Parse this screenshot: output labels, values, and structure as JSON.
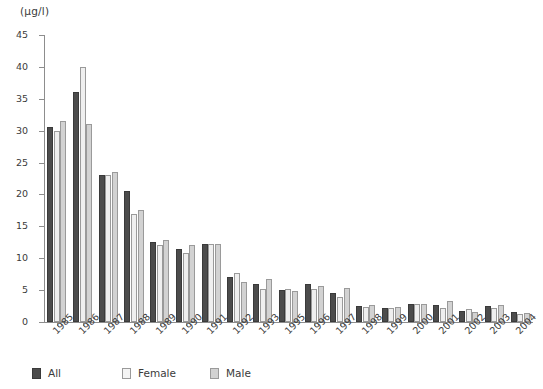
{
  "chart_data": {
    "type": "bar",
    "title": "",
    "subtitle": "",
    "unit_label": "(µg/l)",
    "xlabel": "",
    "ylabel": "",
    "ylim": [
      0,
      45
    ],
    "ytick_step": 5,
    "yticks": [
      0,
      5,
      10,
      15,
      20,
      25,
      30,
      35,
      40,
      45
    ],
    "ytick_labels": [
      "0",
      "5",
      "10",
      "15",
      "20",
      "25",
      "30",
      "35",
      "40",
      "45"
    ],
    "grid": false,
    "legend_position": "bottom-left",
    "categories": [
      "1985",
      "1986",
      "1987",
      "1988",
      "1989",
      "1990",
      "1991",
      "1992",
      "1993",
      "1995",
      "1996",
      "1997",
      "1998",
      "1999",
      "2000",
      "2001",
      "2002",
      "2003",
      "2004"
    ],
    "series": [
      {
        "name": "All",
        "color": "#4c4c4c",
        "values": [
          30.5,
          36.0,
          23.0,
          20.5,
          12.5,
          11.5,
          12.2,
          7.0,
          6.0,
          5.0,
          6.0,
          4.5,
          2.5,
          2.2,
          2.9,
          2.7,
          1.8,
          2.5,
          1.5
        ]
      },
      {
        "name": "Female",
        "color": "#efefef",
        "values": [
          30.0,
          40.0,
          23.0,
          17.0,
          12.0,
          10.8,
          12.2,
          7.7,
          5.2,
          5.2,
          5.2,
          4.0,
          2.3,
          2.2,
          2.9,
          2.2,
          2.0,
          2.2,
          1.3
        ]
      },
      {
        "name": "Male",
        "color": "#d2d2d2",
        "values": [
          31.5,
          31.0,
          23.5,
          17.5,
          12.8,
          12.0,
          12.3,
          6.3,
          6.8,
          4.9,
          5.7,
          5.3,
          2.7,
          2.3,
          2.9,
          3.3,
          1.6,
          2.6,
          1.4
        ]
      }
    ]
  },
  "legend": {
    "items": [
      {
        "label": "All",
        "swatch": "all"
      },
      {
        "label": "Female",
        "swatch": "female"
      },
      {
        "label": "Male",
        "swatch": "male"
      }
    ]
  }
}
